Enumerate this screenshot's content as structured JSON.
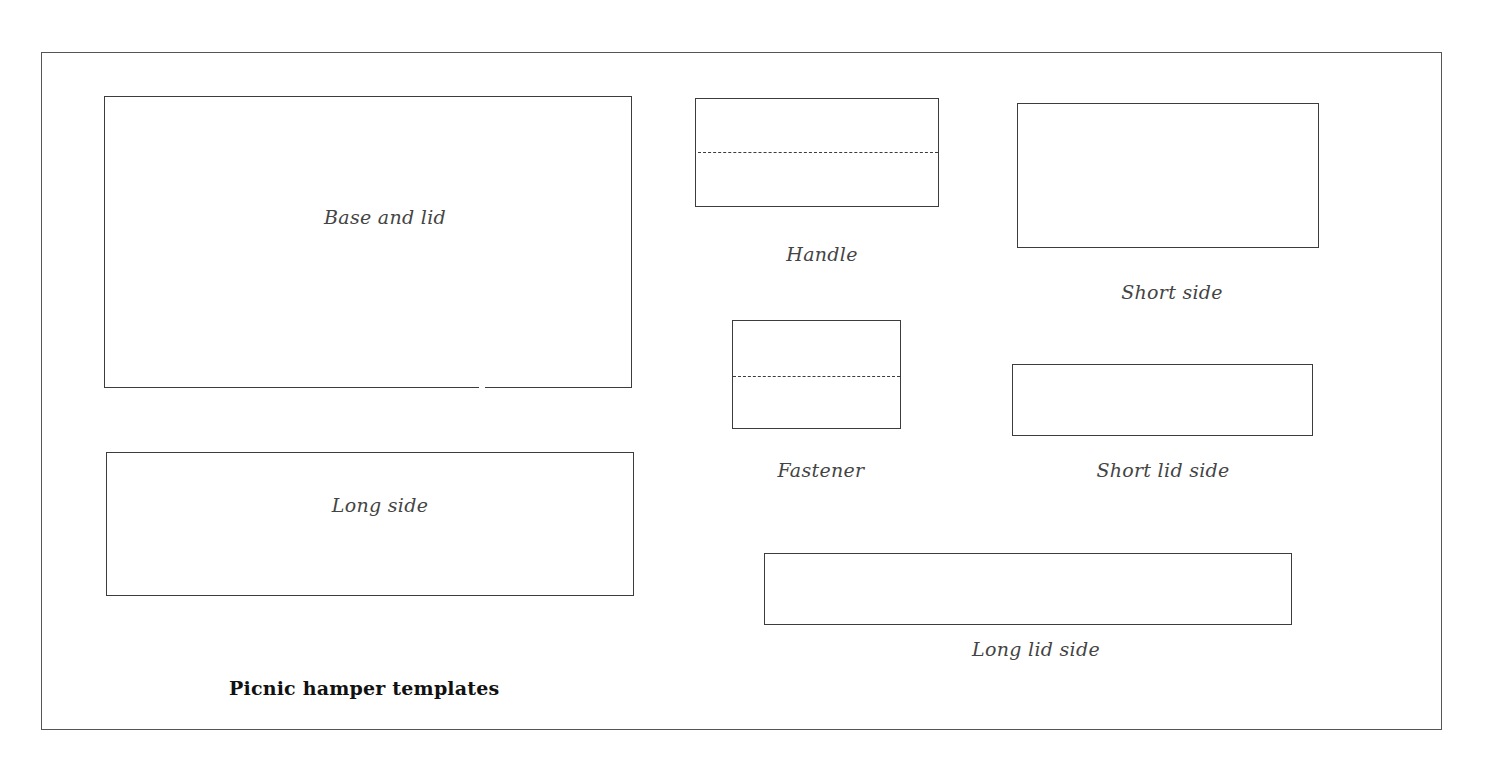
{
  "document": {
    "title": "Picnic hamper templates",
    "colors": {
      "line": "#3c3c3c",
      "label_text": "#444444",
      "title_text": "#111111",
      "background": "#ffffff"
    }
  },
  "templates": [
    {
      "id": "base-and-lid",
      "label": "Base and lid",
      "fold_line": false
    },
    {
      "id": "handle",
      "label": "Handle",
      "fold_line": true
    },
    {
      "id": "short-side",
      "label": "Short side",
      "fold_line": false
    },
    {
      "id": "fastener",
      "label": "Fastener",
      "fold_line": true
    },
    {
      "id": "short-lid-side",
      "label": "Short lid side",
      "fold_line": false
    },
    {
      "id": "long-side",
      "label": "Long side",
      "fold_line": false
    },
    {
      "id": "long-lid-side",
      "label": "Long lid side",
      "fold_line": false
    }
  ]
}
